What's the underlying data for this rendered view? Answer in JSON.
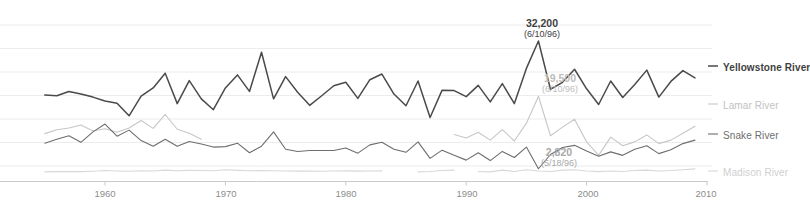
{
  "chart_data": {
    "type": "line",
    "title": "",
    "subtitle": "",
    "xlabel": "",
    "ylabel": "",
    "xlim": [
      1955,
      2010
    ],
    "ylim": [
      0,
      35000
    ],
    "grid": true,
    "gridlines_horizontal": true,
    "legend_position": "right-inline-series-labels",
    "tick_labels_x": [
      "1960",
      "1970",
      "1980",
      "1990",
      "2000",
      "2010"
    ],
    "tick_values_x": [
      1960,
      1970,
      1980,
      1990,
      2000,
      2010
    ],
    "tick_labels_y": [],
    "series": [
      {
        "name": "Yellowstone River",
        "color": "#4a4a4a",
        "emphasis": "bold",
        "x": [
          1955,
          1956,
          1957,
          1958,
          1959,
          1960,
          1961,
          1962,
          1963,
          1964,
          1965,
          1966,
          1967,
          1968,
          1969,
          1970,
          1971,
          1972,
          1973,
          1974,
          1975,
          1976,
          1977,
          1978,
          1979,
          1980,
          1981,
          1982,
          1983,
          1984,
          1985,
          1986,
          1987,
          1988,
          1989,
          1990,
          1991,
          1992,
          1993,
          1994,
          1995,
          1996,
          1997,
          1998,
          1999,
          2000,
          2001,
          2002,
          2003,
          2004,
          2005,
          2006,
          2007,
          2008,
          2009
        ],
        "values": [
          19800,
          19600,
          20600,
          20000,
          19300,
          18400,
          17900,
          15000,
          19500,
          21400,
          24800,
          17800,
          23100,
          18900,
          16400,
          21400,
          24400,
          20600,
          29600,
          18900,
          24000,
          20400,
          17400,
          19600,
          21900,
          22700,
          19000,
          23300,
          24600,
          20000,
          17300,
          23000,
          14600,
          20900,
          20800,
          19400,
          22000,
          18200,
          22400,
          17800,
          25900,
          32200,
          21100,
          22700,
          25700,
          21200,
          17600,
          23000,
          19200,
          22200,
          25500,
          19300,
          22900,
          25400,
          23700
        ]
      },
      {
        "name": "Lamar River",
        "color": "#c7c7c7",
        "emphasis": "normal",
        "segments": [
          {
            "x": [
              1955,
              1956,
              1957,
              1958,
              1959,
              1960,
              1961,
              1962,
              1963,
              1964,
              1965,
              1966,
              1967,
              1968
            ],
            "values": [
              10900,
              11800,
              12200,
              12900,
              11500,
              12000,
              11200,
              12200,
              13900,
              12100,
              15300,
              11900,
              11000,
              9600
            ]
          },
          {
            "x": [
              1989,
              1990,
              1991,
              1992,
              1993,
              1994,
              1995,
              1996,
              1997,
              1998,
              1999,
              2000,
              2001,
              2002,
              2003,
              2004,
              2005,
              2006,
              2007,
              2008,
              2009
            ],
            "values": [
              10700,
              9900,
              11200,
              9400,
              11800,
              9200,
              13300,
              19500,
              10400,
              12400,
              14200,
              9000,
              5900,
              10100,
              8100,
              9000,
              10600,
              8600,
              9400,
              11000,
              12600
            ]
          }
        ]
      },
      {
        "name": "Snake River",
        "color": "#6e6e6e",
        "emphasis": "normal",
        "x": [
          1955,
          1956,
          1957,
          1958,
          1959,
          1960,
          1961,
          1962,
          1963,
          1964,
          1965,
          1966,
          1967,
          1968,
          1969,
          1970,
          1971,
          1972,
          1973,
          1974,
          1975,
          1976,
          1977,
          1978,
          1979,
          1980,
          1981,
          1982,
          1983,
          1984,
          1985,
          1986,
          1987,
          1988,
          1989,
          1990,
          1991,
          1992,
          1993,
          1994,
          1995,
          1996,
          1997,
          1998,
          1999,
          2000,
          2001,
          2002,
          2003,
          2004,
          2005,
          2006,
          2007,
          2008,
          2009
        ],
        "values": [
          8700,
          9600,
          10400,
          8900,
          11300,
          13100,
          10300,
          11700,
          9300,
          8000,
          9600,
          8000,
          9100,
          8500,
          7800,
          7900,
          8700,
          6500,
          8000,
          11300,
          7300,
          6800,
          7000,
          7000,
          7000,
          7600,
          6400,
          8300,
          8900,
          7300,
          6600,
          9000,
          5200,
          7100,
          5900,
          4800,
          6500,
          4700,
          6800,
          5400,
          7800,
          2820,
          6100,
          7700,
          8200,
          6900,
          5700,
          6700,
          5900,
          7300,
          8100,
          6300,
          7200,
          8600,
          9400
        ]
      },
      {
        "name": "Madison River",
        "color": "#d8d8d8",
        "emphasis": "normal",
        "segments": [
          {
            "x": [
              1955,
              1956,
              1957,
              1958,
              1959,
              1960,
              1961,
              1962,
              1963,
              1964,
              1965,
              1966,
              1967,
              1968,
              1969,
              1970,
              1971,
              1972,
              1973,
              1974,
              1975,
              1976,
              1977,
              1978,
              1979,
              1980,
              1981,
              1982,
              1983
            ],
            "values": [
              2100,
              2150,
              2200,
              2150,
              2250,
              2400,
              2300,
              2250,
              2350,
              2300,
              2500,
              2350,
              2450,
              2400,
              2350,
              2600,
              2450,
              2350,
              2400,
              2350,
              2300,
              2280,
              2300,
              2250,
              2300,
              2320,
              2280,
              2300,
              2320
            ]
          },
          {
            "x": [
              1986,
              1987,
              1988,
              1989
            ],
            "values": [
              2100,
              2200,
              2400,
              2500
            ]
          },
          {
            "x": [
              1991,
              1992,
              1993,
              1994,
              1995,
              1996,
              1997,
              1998,
              1999,
              2000,
              2001,
              2002,
              2003,
              2004,
              2005,
              2006,
              2007,
              2008,
              2009
            ],
            "values": [
              2200,
              2100,
              2500,
              2200,
              2600,
              2300,
              2200,
              2500,
              2600,
              2300,
              2150,
              2300,
              2200,
              2400,
              2500,
              2300,
              2400,
              2600,
              2800
            ]
          }
        ]
      }
    ],
    "annotations": [
      {
        "id": "yellowstone-peak",
        "series": "Yellowstone River",
        "value_label": "32,200",
        "date_label": "(6/10/96)",
        "x": 1996,
        "value": 32200,
        "color": "#4a4a4a"
      },
      {
        "id": "lamar-peak",
        "series": "Lamar River",
        "value_label": "19,500",
        "date_label": "(6/10/96)",
        "x": 1996,
        "value": 19500,
        "color": "#bdbdbd"
      },
      {
        "id": "snake-low",
        "series": "Snake River",
        "value_label": "2,820",
        "date_label": "(5/18/96)",
        "x": 1996,
        "value": 2820,
        "color": "#a8a8a8"
      }
    ]
  },
  "axis": {
    "ticks": [
      {
        "label": "1960"
      },
      {
        "label": "1970"
      },
      {
        "label": "1980"
      },
      {
        "label": "1990"
      },
      {
        "label": "2000"
      },
      {
        "label": "2010"
      }
    ]
  },
  "series_labels": [
    {
      "text": "Yellowstone River"
    },
    {
      "text": "Lamar River"
    },
    {
      "text": "Snake River"
    },
    {
      "text": "Madison River"
    }
  ],
  "annotation_text": {
    "peak_value": "32,200",
    "peak_date": "(6/10/96)",
    "lamar_value": "19,500",
    "lamar_date": "(6/10/96)",
    "snake_value": "2,820",
    "snake_date": "(5/18/96)"
  },
  "colors": {
    "yellowstone": "#4a4a4a",
    "lamar": "#c7c7c7",
    "snake": "#6e6e6e",
    "madison": "#d8d8d8",
    "gridline": "#ececec",
    "axis": "#c9c9c9",
    "tick_text": "#8d8d8d"
  }
}
